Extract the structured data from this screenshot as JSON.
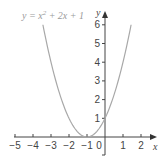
{
  "chart_data": {
    "type": "line",
    "title_parts": {
      "pre": "y = x",
      "sup": "2",
      "post": " + 2x + 1"
    },
    "xlabel": "x",
    "ylabel": "y",
    "xlim": [
      -5,
      2
    ],
    "ylim": [
      0,
      6
    ],
    "x_ticks": [
      "−5",
      "−4",
      "−3",
      "−2",
      "−1",
      "0",
      "1",
      "2"
    ],
    "y_ticks": [
      "1",
      "2",
      "3",
      "4",
      "5",
      "6"
    ],
    "grid": false,
    "legend": "none",
    "series": [
      {
        "name": "y = x² + 2x + 1",
        "color": "#a8a8a8",
        "x": [
          -3.45,
          -3,
          -2.5,
          -2,
          -1.5,
          -1,
          -0.5,
          0,
          0.5,
          1,
          1.45
        ],
        "y": [
          6.0,
          4,
          2.25,
          1,
          0.25,
          0,
          0.25,
          1,
          2.25,
          4,
          6.0
        ]
      }
    ]
  },
  "colors": {
    "axis": "#444444",
    "curve": "#a8a8a8",
    "title": "#9a9a9a"
  }
}
